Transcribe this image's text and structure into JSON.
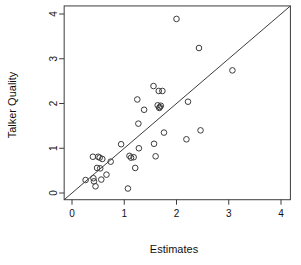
{
  "chart_data": {
    "type": "scatter",
    "title": "",
    "xlabel": "Estimates",
    "ylabel": "Talker Quality",
    "xlim": [
      -0.15,
      4.18
    ],
    "ylim": [
      -0.15,
      4.18
    ],
    "xticks": [
      0,
      1,
      2,
      3,
      4
    ],
    "yticks": [
      0,
      1,
      2,
      3,
      4
    ],
    "xtick_labels": [
      "0",
      "1",
      "2",
      "3",
      "4"
    ],
    "ytick_labels": [
      "0",
      "1",
      "2",
      "3",
      "4"
    ],
    "grid": false,
    "legend": null,
    "marker": "open-circle",
    "marker_color": "#3c3c3c",
    "reference_line": {
      "type": "identity",
      "label": "y = x",
      "from": [
        -0.15,
        -0.15
      ],
      "to": [
        4.18,
        4.18
      ],
      "color": "#3c3c3c"
    },
    "points": [
      {
        "x": 0.26,
        "y": 0.29
      },
      {
        "x": 0.4,
        "y": 0.81
      },
      {
        "x": 0.41,
        "y": 0.33
      },
      {
        "x": 0.42,
        "y": 0.26
      },
      {
        "x": 0.45,
        "y": 0.15
      },
      {
        "x": 0.48,
        "y": 0.56
      },
      {
        "x": 0.5,
        "y": 0.81
      },
      {
        "x": 0.53,
        "y": 0.79
      },
      {
        "x": 0.54,
        "y": 0.55
      },
      {
        "x": 0.56,
        "y": 0.3
      },
      {
        "x": 0.58,
        "y": 0.76
      },
      {
        "x": 0.66,
        "y": 0.41
      },
      {
        "x": 0.74,
        "y": 0.7
      },
      {
        "x": 0.94,
        "y": 1.09
      },
      {
        "x": 1.07,
        "y": 0.1
      },
      {
        "x": 1.1,
        "y": 0.83
      },
      {
        "x": 1.13,
        "y": 0.79
      },
      {
        "x": 1.18,
        "y": 0.8
      },
      {
        "x": 1.21,
        "y": 0.56
      },
      {
        "x": 1.25,
        "y": 2.09
      },
      {
        "x": 1.27,
        "y": 1.55
      },
      {
        "x": 1.28,
        "y": 1.0
      },
      {
        "x": 1.38,
        "y": 1.86
      },
      {
        "x": 1.56,
        "y": 2.39
      },
      {
        "x": 1.57,
        "y": 1.1
      },
      {
        "x": 1.6,
        "y": 0.82
      },
      {
        "x": 1.64,
        "y": 1.96
      },
      {
        "x": 1.66,
        "y": 2.28
      },
      {
        "x": 1.67,
        "y": 1.9
      },
      {
        "x": 1.68,
        "y": 1.92
      },
      {
        "x": 1.7,
        "y": 1.95
      },
      {
        "x": 1.73,
        "y": 2.28
      },
      {
        "x": 1.76,
        "y": 1.35
      },
      {
        "x": 2.0,
        "y": 3.89
      },
      {
        "x": 2.19,
        "y": 1.2
      },
      {
        "x": 2.22,
        "y": 2.04
      },
      {
        "x": 2.43,
        "y": 3.24
      },
      {
        "x": 2.46,
        "y": 1.4
      },
      {
        "x": 3.07,
        "y": 2.74
      }
    ]
  },
  "axes": {
    "x_title": "Estimates",
    "y_title": "Talker Quality"
  }
}
